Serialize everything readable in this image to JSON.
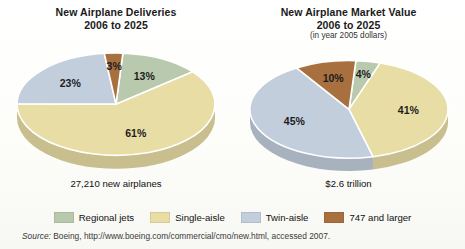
{
  "chart_data": [
    {
      "type": "pie",
      "title": "New Airplane Deliveries",
      "subtitle": "2006 to 2025",
      "note": "",
      "categories": [
        "Regional jets",
        "Single-aisle",
        "Twin-aisle",
        "747 and larger"
      ],
      "values": [
        13,
        61,
        23,
        3
      ],
      "labels": [
        "13%",
        "61%",
        "23%",
        "3%"
      ],
      "colors": [
        "#b9c9ae",
        "#e8dda5",
        "#c3cedd",
        "#a9703f"
      ],
      "total_caption": "27,210 new airplanes",
      "units": "percent of deliveries",
      "legend_position": "bottom-shared"
    },
    {
      "type": "pie",
      "title": "New Airplane Market Value",
      "subtitle": "2006 to 2025",
      "note": "(in year 2005 dollars)",
      "categories": [
        "Regional jets",
        "Single-aisle",
        "Twin-aisle",
        "747 and larger"
      ],
      "values": [
        4,
        41,
        45,
        10
      ],
      "labels": [
        "4%",
        "41%",
        "45%",
        "10%"
      ],
      "colors": [
        "#b9c9ae",
        "#e8dda5",
        "#c3cedd",
        "#a9703f"
      ],
      "total_caption": "$2.6 trillion",
      "units": "percent of market value",
      "legend_position": "bottom-shared"
    }
  ],
  "left_panel": {
    "title_line1": "New Airplane Deliveries",
    "title_line2": "2006 to 2025",
    "caption": "27,210 new airplanes",
    "slice_labels": [
      "13%",
      "61%",
      "23%",
      "3%"
    ]
  },
  "right_panel": {
    "title_line1": "New Airplane Market Value",
    "title_line2": "2006 to 2025",
    "subtitle": "(in year 2005 dollars)",
    "caption": "$2.6 trillion",
    "slice_labels": [
      "4%",
      "41%",
      "45%",
      "10%"
    ]
  },
  "legend": {
    "items": [
      {
        "label": "Regional jets",
        "color": "#b9c9ae"
      },
      {
        "label": "Single-aisle",
        "color": "#e8dda5"
      },
      {
        "label": "Twin-aisle",
        "color": "#c3cedd"
      },
      {
        "label": "747 and larger",
        "color": "#a9703f"
      }
    ]
  },
  "source": {
    "word": "Source:",
    "text": " Boeing, http://www.boeing.com/commercial/cmo/new.html, accessed 2007."
  }
}
